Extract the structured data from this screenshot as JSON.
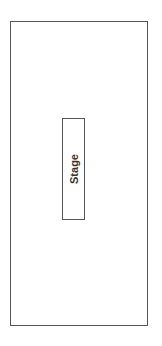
{
  "diagram": {
    "room": {
      "label": ""
    },
    "stage": {
      "label": "Stage"
    },
    "colors": {
      "stroke": "#555555",
      "text": "#333333",
      "background": "#ffffff"
    }
  }
}
